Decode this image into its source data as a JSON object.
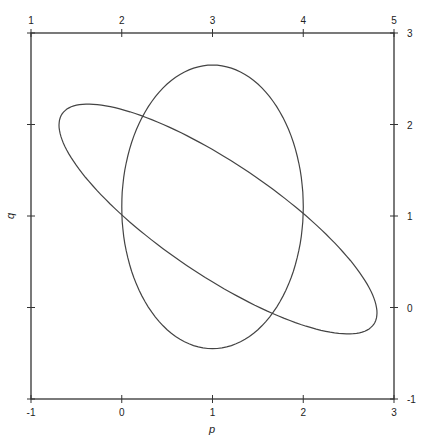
{
  "chart_data": {
    "type": "line",
    "title": "",
    "xlabel": "p",
    "ylabel": "q",
    "xlim": [
      -1,
      3
    ],
    "ylim": [
      -1,
      3
    ],
    "grid": false,
    "legend": null,
    "bottom_axis": {
      "ticks": [
        -1,
        0,
        1,
        2,
        3
      ],
      "labels": [
        "-1",
        "0",
        "1",
        "2",
        "3"
      ]
    },
    "top_axis": {
      "ticks": [
        -1,
        0,
        1,
        2,
        3
      ],
      "labels": [
        "1",
        "2",
        "3",
        "4",
        "5"
      ]
    },
    "left_axis": {
      "ticks": [
        -1,
        0,
        1,
        2,
        3
      ],
      "labels": []
    },
    "right_axis": {
      "ticks": [
        -1,
        0,
        1,
        2,
        3
      ],
      "labels": [
        "-1",
        "0",
        "1",
        "2",
        "3"
      ]
    },
    "series": [
      {
        "name": "ellipse-upright",
        "shape": "ellipse",
        "center": [
          1.0,
          1.1
        ],
        "semi_axes": [
          1.0,
          1.55
        ],
        "rotation_deg": 0,
        "approx_points": [
          [
            2.0,
            1.1
          ],
          [
            1.0,
            2.65
          ],
          [
            0.0,
            1.1
          ],
          [
            1.0,
            -0.45
          ]
        ]
      },
      {
        "name": "ellipse-tilted",
        "shape": "ellipse",
        "center": [
          1.1,
          1.0
        ],
        "approx_points": [
          [
            -0.66,
            2.12
          ],
          [
            -0.42,
            2.33
          ],
          [
            2.88,
            -0.08
          ],
          [
            2.6,
            -0.45
          ],
          [
            0.0,
            1.0
          ],
          [
            2.0,
            1.0
          ]
        ]
      }
    ],
    "intersections": [
      [
        0.0,
        1.0
      ],
      [
        2.0,
        1.0
      ],
      [
        0.47,
        2.13
      ],
      [
        1.59,
        -0.2
      ]
    ]
  }
}
